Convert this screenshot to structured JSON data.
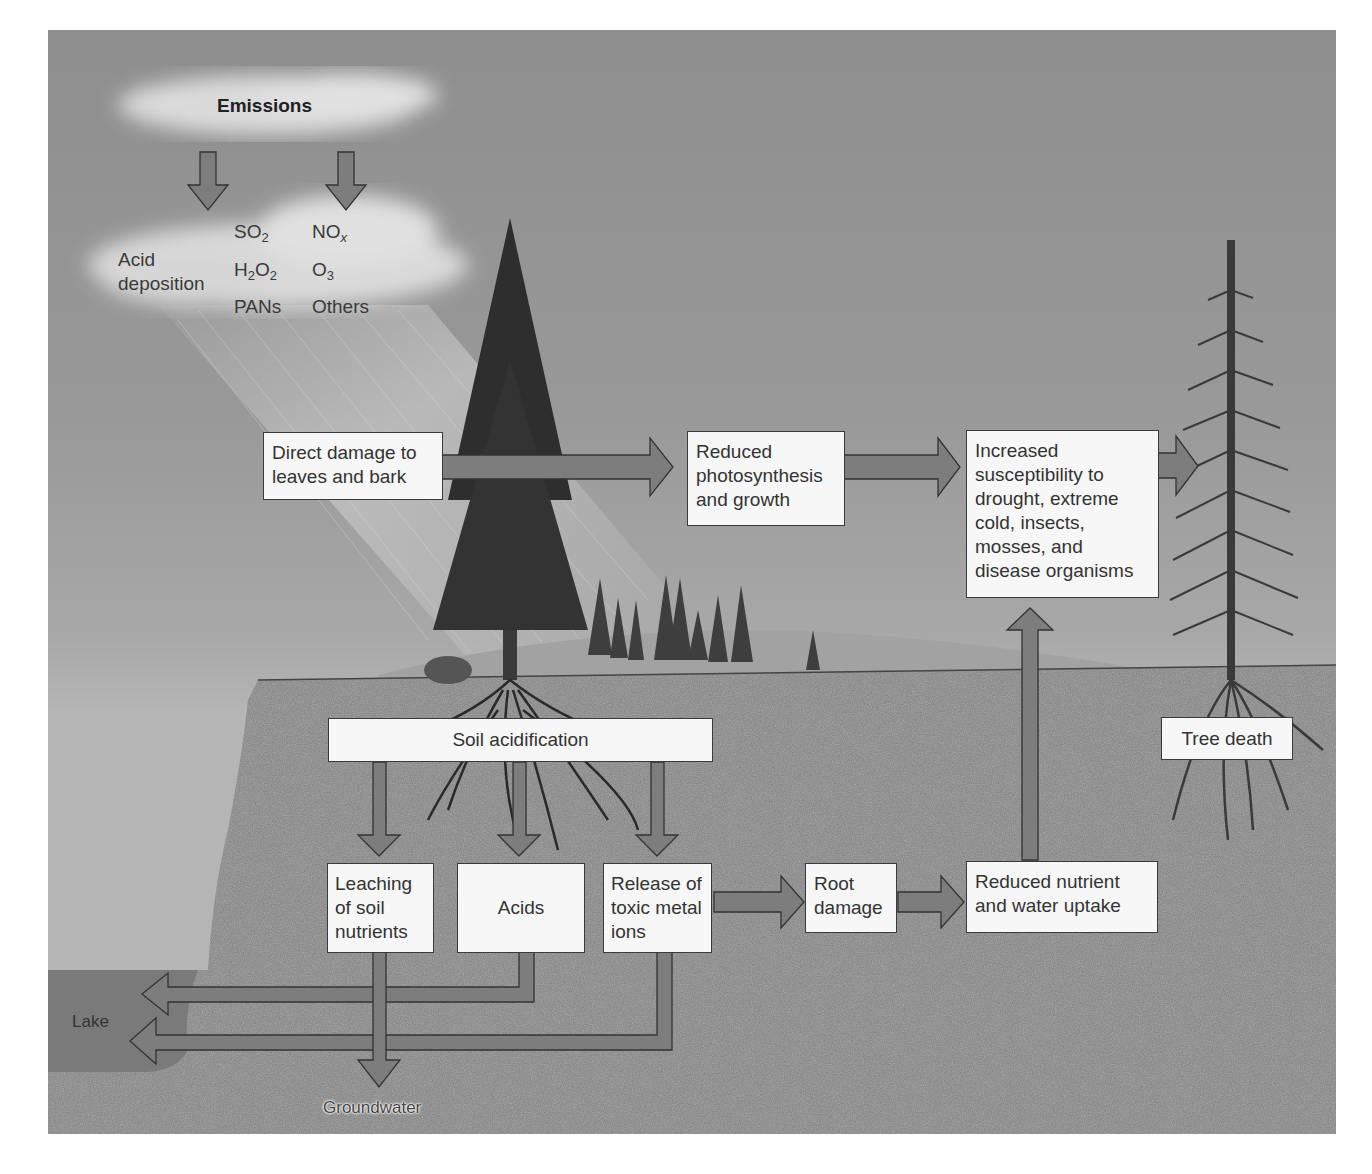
{
  "diagram": {
    "colors": {
      "sky": "#999999",
      "soil": "#8a8a8a",
      "box_fill": "#f7f7f7",
      "box_border": "#3a3a3a",
      "arrow_fill": "#7d7d7d",
      "lake": "#7a7a7a"
    },
    "sky": {
      "emissions_label": "Emissions",
      "acid_deposition_line1": "Acid",
      "acid_deposition_line2": "deposition",
      "pollutants": [
        {
          "base": "SO",
          "sub": "2",
          "tail": ""
        },
        {
          "base": "NO",
          "sub": "x",
          "tail": ""
        },
        {
          "base": "H",
          "sub": "2",
          "tail": "O",
          "sub2": "2"
        },
        {
          "base": "O",
          "sub": "3",
          "tail": ""
        },
        {
          "text": "PANs"
        },
        {
          "text": "Others"
        }
      ]
    },
    "boxes": {
      "direct_damage": "Direct damage to leaves and bark",
      "reduced_photosynthesis": "Reduced photosynthesis and growth",
      "increased_susceptibility": "Increased susceptibility to drought, extreme cold, insects, mosses, and disease organisms",
      "soil_acidification": "Soil acidification",
      "leaching": "Leaching of soil nutrients",
      "acids": "Acids",
      "release_toxic": "Release of toxic metal ions",
      "root_damage": "Root damage",
      "reduced_uptake": "Reduced nutrient and water uptake",
      "tree_death": "Tree death"
    },
    "labels": {
      "lake": "Lake",
      "groundwater": "Groundwater"
    },
    "flows": [
      {
        "from": "Emissions",
        "to": "Acid deposition"
      },
      {
        "from": "Direct damage to leaves and bark",
        "to": "Reduced photosynthesis and growth"
      },
      {
        "from": "Reduced photosynthesis and growth",
        "to": "Increased susceptibility"
      },
      {
        "from": "Increased susceptibility",
        "to": "Tree death"
      },
      {
        "from": "Soil acidification",
        "to": "Leaching of soil nutrients"
      },
      {
        "from": "Soil acidification",
        "to": "Acids"
      },
      {
        "from": "Soil acidification",
        "to": "Release of toxic metal ions"
      },
      {
        "from": "Release of toxic metal ions",
        "to": "Root damage"
      },
      {
        "from": "Root damage",
        "to": "Reduced nutrient and water uptake"
      },
      {
        "from": "Reduced nutrient and water uptake",
        "to": "Increased susceptibility"
      },
      {
        "from": "Leaching of soil nutrients",
        "to": "Groundwater"
      },
      {
        "from": "Acids",
        "to": "Lake"
      },
      {
        "from": "Release of toxic metal ions",
        "to": "Lake"
      }
    ]
  }
}
